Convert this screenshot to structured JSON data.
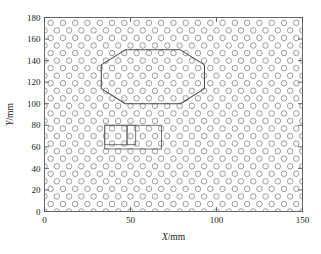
{
  "figure": {
    "background": "#ffffff",
    "axis_color": "#555555",
    "marker_color": "#8a8a8a",
    "region_color": "#4a4a4a"
  },
  "chart_data": {
    "type": "scatter",
    "title": "",
    "xlabel": "X/mm",
    "ylabel": "Y/mm",
    "xlim": [
      0,
      150
    ],
    "ylim": [
      0,
      180
    ],
    "xticks": [
      0,
      50,
      100,
      150
    ],
    "yticks": [
      0,
      20,
      40,
      60,
      80,
      100,
      120,
      140,
      160,
      180
    ],
    "xticklabels": [
      "0",
      "50",
      "100",
      "150"
    ],
    "yticklabels": [
      "0",
      "20",
      "40",
      "60",
      "80",
      "100",
      "120",
      "140",
      "160",
      "180"
    ],
    "grid": false,
    "legend": null,
    "marker": {
      "shape": "circle-open",
      "size_mm": 3.2,
      "edge_color": "#8a8a8a",
      "fill": "none"
    },
    "lattice": {
      "description": "staggered hexagonal array of open circles",
      "col_spacing_mm": 7.14,
      "row_spacing_mm": 7.0,
      "row_offset_mm": 3.57,
      "n_cols": 22,
      "n_rows": 26,
      "x_start_mm": 0,
      "y_start_mm": 0
    },
    "annotations": [
      {
        "name": "octagon-region",
        "type": "polygon",
        "stroke": "#4a4a4a",
        "fill": "none",
        "vertices_mm": [
          [
            47.0,
            150.0
          ],
          [
            79.0,
            150.0
          ],
          [
            93.0,
            136.0
          ],
          [
            93.0,
            114.0
          ],
          [
            79.0,
            100.0
          ],
          [
            47.0,
            100.0
          ],
          [
            33.0,
            114.0
          ],
          [
            33.0,
            136.0
          ]
        ]
      },
      {
        "name": "outer-rectangle-region",
        "type": "rect",
        "stroke": "#6a6a6a",
        "fill": "none",
        "x_mm": 35.0,
        "y_mm": 58.0,
        "width_mm": 33.0,
        "height_mm": 22.0
      },
      {
        "name": "inner-rectangle-left",
        "type": "rect",
        "stroke": "#6a6a6a",
        "fill": "none",
        "x_mm": 35.0,
        "y_mm": 62.0,
        "width_mm": 13.0,
        "height_mm": 18.0
      },
      {
        "name": "inner-rectangle-middle",
        "type": "rect",
        "stroke": "#6a6a6a",
        "fill": "none",
        "x_mm": 48.0,
        "y_mm": 62.0,
        "width_mm": 5.0,
        "height_mm": 18.0
      }
    ]
  }
}
